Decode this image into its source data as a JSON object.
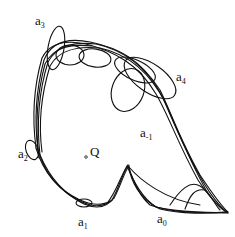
{
  "diagram": {
    "type": "orbit-tangle",
    "stroke_color": "#111111",
    "background": "#ffffff",
    "center_point": {
      "label": "Q",
      "x": 86,
      "y": 156
    },
    "labels": [
      {
        "id": "a3",
        "base": "a",
        "sub": "3",
        "x": 35,
        "y": 18
      },
      {
        "id": "a4",
        "base": "a",
        "sub": "4",
        "x": 176,
        "y": 74
      },
      {
        "id": "a-1",
        "base": "a",
        "sub": "-1",
        "x": 140,
        "y": 130
      },
      {
        "id": "a2",
        "base": "a",
        "sub": "2",
        "x": 18,
        "y": 150
      },
      {
        "id": "a1",
        "base": "a",
        "sub": "1",
        "x": 78,
        "y": 218
      },
      {
        "id": "a0",
        "base": "a",
        "sub": "0",
        "x": 157,
        "y": 215
      }
    ]
  }
}
